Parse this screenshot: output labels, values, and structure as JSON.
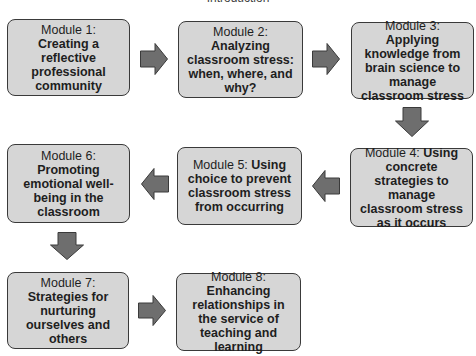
{
  "title": "Introduction",
  "modules": [
    {
      "lead": "Module 1: ",
      "bold": "Creating a reflective professional community"
    },
    {
      "lead": "Module 2: ",
      "bold": "Analyzing classroom stress: when, where, and why?"
    },
    {
      "lead": "Module 3: ",
      "bold": "Applying knowledge from brain science to manage classroom stress"
    },
    {
      "lead": "Module 4: ",
      "bold": "Using concrete strategies to manage classroom stress as it occurs"
    },
    {
      "lead": "Module 5: ",
      "bold": "Using choice to prevent classroom stress from occurring"
    },
    {
      "lead": "Module 6: ",
      "bold": "Promoting emotional well-being in the classroom"
    },
    {
      "lead": "Module 7: ",
      "bold": "Strategies for nurturing ourselves and others"
    },
    {
      "lead": "Module 8: ",
      "bold": "Enhancing relationships in the service of teaching and learning"
    }
  ],
  "flow": [
    {
      "from": 1,
      "to": 2,
      "direction": "right"
    },
    {
      "from": 2,
      "to": 3,
      "direction": "right"
    },
    {
      "from": 3,
      "to": 4,
      "direction": "down"
    },
    {
      "from": 4,
      "to": 5,
      "direction": "left"
    },
    {
      "from": 5,
      "to": 6,
      "direction": "left"
    },
    {
      "from": 6,
      "to": 7,
      "direction": "down"
    },
    {
      "from": 7,
      "to": 8,
      "direction": "right"
    }
  ],
  "colors": {
    "box_fill": "#d6d6d6",
    "box_border": "#3a3a3a",
    "arrow_fill": "#6e6e6e",
    "arrow_border": "#3a3a3a"
  }
}
